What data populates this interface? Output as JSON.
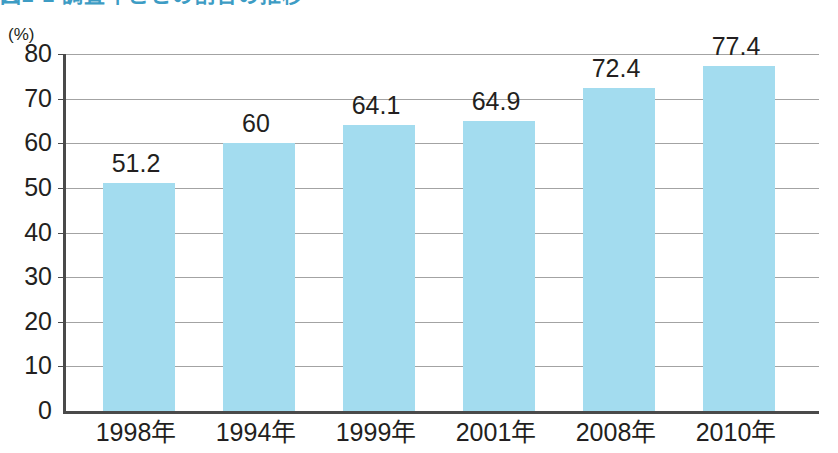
{
  "figure": {
    "title": "図2-2 調査年ごとの割合の推移",
    "title_color": "#3d9cc4"
  },
  "chart_data": {
    "type": "bar",
    "title": "",
    "xlabel": "",
    "ylabel": "(%)",
    "yunit": "(%)",
    "ylim": [
      0,
      80
    ],
    "ytick_labels": [
      "80",
      "70",
      "60",
      "50",
      "40",
      "30",
      "20",
      "10",
      "0"
    ],
    "ytick_values": [
      80,
      70,
      60,
      50,
      40,
      30,
      20,
      10,
      0
    ],
    "grid": true,
    "legend": "none",
    "bar_color": "#a3dcef",
    "categories": [
      "1998年",
      "1994年",
      "1999年",
      "2001年",
      "2008年",
      "2010年"
    ],
    "values": [
      51.2,
      60,
      64.1,
      64.9,
      72.4,
      77.4
    ],
    "value_labels": [
      "51.2",
      "60",
      "64.1",
      "64.9",
      "72.4",
      "77.4"
    ]
  }
}
